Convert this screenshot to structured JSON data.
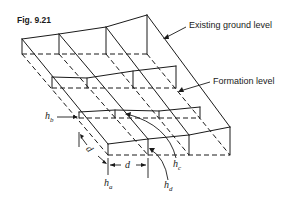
{
  "figure": {
    "label": "Fig. 9.21"
  },
  "annotations": {
    "existing_ground_level": "Existing ground level",
    "formation_level": "Formation level"
  },
  "variables": {
    "h_base": "h",
    "ha_sub": "a",
    "hb_sub": "b",
    "hc_sub": "c",
    "hd_sub": "d",
    "d_horizontal": "d",
    "d_diagonal": "d"
  },
  "colors": {
    "line": "#1a1a1a",
    "background": "#ffffff"
  }
}
